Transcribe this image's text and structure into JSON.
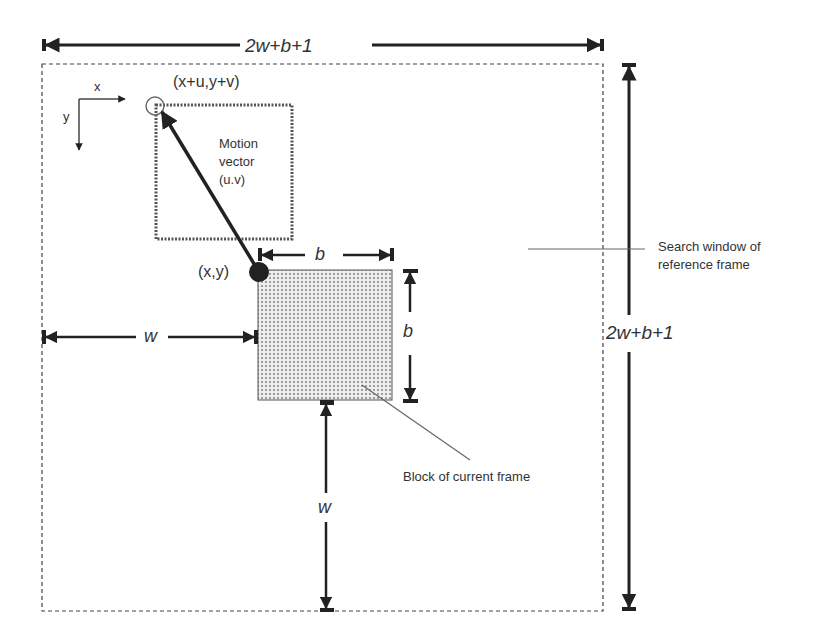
{
  "diagram": {
    "top_dimension": "2w+b+1",
    "right_dimension": "2w+b+1",
    "axis_x": "x",
    "axis_y": "y",
    "matched_point": "(x+u,y+v)",
    "current_point": "(x,y)",
    "motion_vector_line1": "Motion",
    "motion_vector_line2": "vector",
    "motion_vector_line3": "(u.v)",
    "block_width": "b",
    "block_height": "b",
    "left_margin": "w",
    "bottom_margin": "w",
    "search_window_line1": "Search window of",
    "search_window_line2": "reference frame",
    "block_label": "Block of current frame"
  },
  "colors": {
    "ink": "#222222",
    "block_fill": "#e4e4e4",
    "leader": "#666666"
  }
}
